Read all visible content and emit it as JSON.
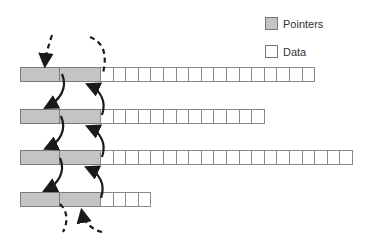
{
  "legend": {
    "pointers_label": "Pointers",
    "data_label": "Data",
    "pointer_color": "#c4c4c4",
    "data_color": "#ffffff"
  },
  "records": [
    {
      "top": 67,
      "pointer_fields": 2,
      "data_cells": 17
    },
    {
      "top": 109,
      "pointer_fields": 2,
      "data_cells": 13
    },
    {
      "top": 150,
      "pointer_fields": 2,
      "data_cells": 20
    },
    {
      "top": 192,
      "pointer_fields": 2,
      "data_cells": 4
    }
  ],
  "arrows": {
    "forward": "solid arrows from left pointer field down to next record",
    "backward": "solid arrows from right pointer field up to previous record",
    "external": "dashed arrows entering first record and leaving last record"
  }
}
